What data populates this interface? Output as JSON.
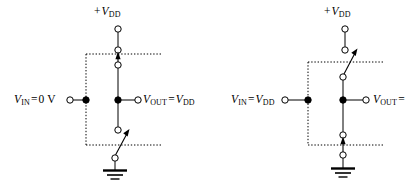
{
  "figure": {
    "background_color": "#ffffff",
    "line_color": "#000000",
    "dotted_color": "#000000",
    "width": 411,
    "height": 187
  },
  "circuits": [
    {
      "id": "left",
      "name": "inverter-input-low",
      "supply_label": {
        "prefix": "+",
        "symbol": "V",
        "subscript": "DD"
      },
      "input_label": {
        "symbol": "V",
        "subscript": "IN",
        "operator": "=",
        "value": "0 V"
      },
      "output_label": {
        "symbol": "V",
        "subscript": "OUT",
        "operator": "=",
        "value_symbol": "V",
        "value_subscript": "DD"
      },
      "pull_up_switch": {
        "name": "pmos-switch",
        "state": "closed"
      },
      "pull_down_switch": {
        "name": "nmos-switch",
        "state": "open"
      },
      "ground": {
        "name": "ground-symbol"
      }
    },
    {
      "id": "right",
      "name": "inverter-input-high",
      "supply_label": {
        "prefix": "+",
        "symbol": "V",
        "subscript": "DD"
      },
      "input_label": {
        "symbol": "V",
        "subscript": "IN",
        "operator": "=",
        "value_symbol": "V",
        "value_subscript": "DD"
      },
      "output_label": {
        "symbol": "V",
        "subscript": "OUT",
        "operator": "=",
        "value_symbol": "",
        "value_subscript": ""
      },
      "pull_up_switch": {
        "name": "pmos-switch",
        "state": "open"
      },
      "pull_down_switch": {
        "name": "nmos-switch",
        "state": "closed"
      },
      "ground": {
        "name": "ground-symbol"
      }
    }
  ]
}
